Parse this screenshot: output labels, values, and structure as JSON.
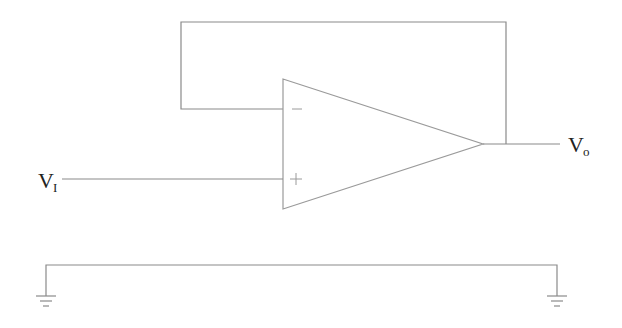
{
  "diagram": {
    "type": "op-amp voltage follower circuit",
    "labels": {
      "input": {
        "main": "V",
        "sub": "I"
      },
      "output": {
        "main": "V",
        "sub": "o"
      },
      "inverting_input": "−",
      "noninverting_input": "+"
    },
    "colors": {
      "wire": "#8a8a8a",
      "text": "#222222",
      "background": "#ffffff"
    }
  }
}
